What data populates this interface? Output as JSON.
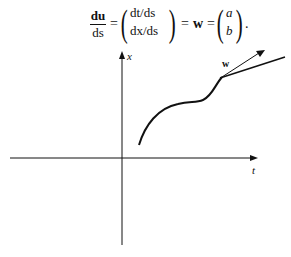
{
  "equation": {
    "lhs_num": "du",
    "lhs_den": "ds",
    "eq1": "=",
    "vec1_top": "dt/ds",
    "vec1_bottom": "dx/ds",
    "eq2": "=",
    "w": "w",
    "eq3": "=",
    "vec2_top": "a",
    "vec2_bottom": "b",
    "end": "."
  },
  "diagram": {
    "x_axis_label": "t",
    "y_axis_label": "x",
    "vector_label": "w"
  }
}
